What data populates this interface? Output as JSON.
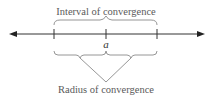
{
  "diagram": {
    "title_top": "Interval of convergence",
    "title_bottom": "Radius of convergence",
    "center_label": "a",
    "colors": {
      "axis": "#333333",
      "brace": "#8a8a8a",
      "text": "#5a5a5a"
    },
    "axis": {
      "y": 34,
      "x_start": 9,
      "x_end": 205,
      "ticks_x": [
        54,
        106,
        157
      ]
    }
  }
}
